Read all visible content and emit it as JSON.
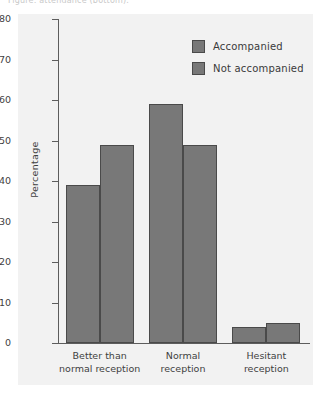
{
  "caption": {
    "text": "Figure: attendance (bottom).",
    "visible": "clipped"
  },
  "legend": {
    "position": "top-right",
    "items": [
      {
        "label": "Accompanied",
        "color": "#787878"
      },
      {
        "label": "Not accompanied",
        "color": "#787878"
      }
    ]
  },
  "axes": {
    "ylabel": "Percentage",
    "yticks": [
      "0",
      "10",
      "20",
      "30",
      "40",
      "50",
      "60",
      "70",
      "80"
    ],
    "xcategories": [
      {
        "line1": "Better than",
        "line2": "normal reception"
      },
      {
        "line1": "Normal",
        "line2": "reception"
      },
      {
        "line1": "Hesitant",
        "line2": "reception"
      }
    ]
  },
  "colors": {
    "bar_fill": "#787878",
    "bar_edge": "#4a4a4a",
    "panel_bg": "#f2f2f2",
    "axis": "#5d5d5d",
    "text": "#3a3a3a"
  },
  "chart_data": {
    "type": "bar",
    "title": "",
    "xlabel": "",
    "ylabel": "Percentage",
    "ylim": [
      0,
      80
    ],
    "ytick_step": 10,
    "grid": false,
    "legend_position": "top-right",
    "categories": [
      "Better than normal reception",
      "Normal reception",
      "Hesitant reception"
    ],
    "series": [
      {
        "name": "Accompanied",
        "values": [
          39,
          59,
          4
        ]
      },
      {
        "name": "Not accompanied",
        "values": [
          49,
          49,
          5
        ]
      }
    ]
  }
}
